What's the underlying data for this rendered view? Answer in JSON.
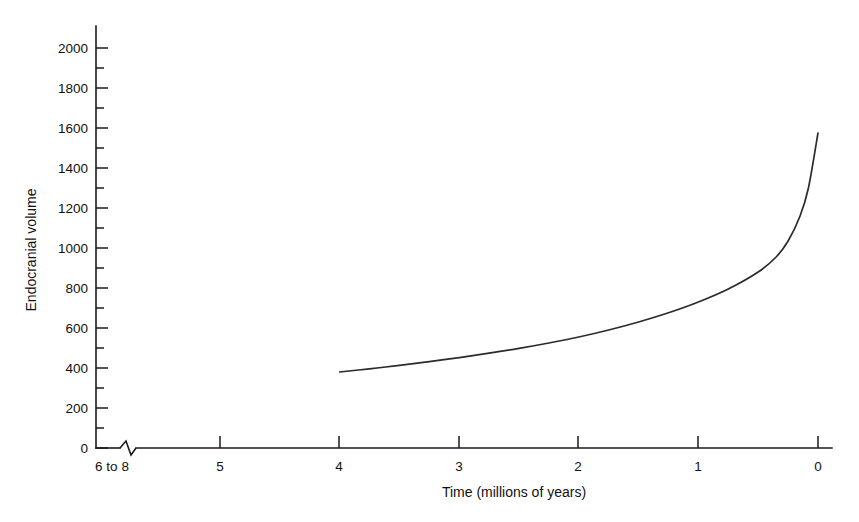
{
  "chart_data": {
    "type": "line",
    "title": "",
    "xlabel": "Time (millions of years)",
    "ylabel": "Endocranial volume",
    "x_tick_labels": [
      "6 to 8",
      "5",
      "4",
      "3",
      "2",
      "1",
      "0"
    ],
    "x_tick_values": [
      6,
      5,
      4,
      3,
      2,
      1,
      0
    ],
    "y_tick_labels": [
      "0",
      "200",
      "400",
      "600",
      "800",
      "1000",
      "1200",
      "1400",
      "1600",
      "1800",
      "2000"
    ],
    "y_tick_values": [
      0,
      200,
      400,
      600,
      800,
      1000,
      1200,
      1400,
      1600,
      1800,
      2000
    ],
    "ylim": [
      0,
      2100
    ],
    "xlim": [
      6,
      0
    ],
    "x_axis_reversed": true,
    "x_axis_break": true,
    "x_axis_break_note": "zigzag break between 6 to 8 and 5",
    "grid": false,
    "legend": false,
    "minor_ticks_y_interval": 100,
    "series": [
      {
        "name": "Endocranial volume",
        "color": "#2b2b2b",
        "x": [
          4.0,
          3.75,
          3.5,
          3.25,
          3.0,
          2.75,
          2.5,
          2.25,
          2.0,
          1.75,
          1.5,
          1.25,
          1.0,
          0.75,
          0.5,
          0.35,
          0.25,
          0.15,
          0.08,
          0.0
        ],
        "y": [
          380,
          396,
          413,
          432,
          452,
          474,
          498,
          525,
          555,
          590,
          630,
          676,
          730,
          795,
          880,
          955,
          1035,
          1160,
          1300,
          1575
        ]
      }
    ]
  },
  "figure": {
    "background_color": "#ffffff",
    "axis_color": "#1a1a1a",
    "curve_color": "#2b2b2b"
  }
}
